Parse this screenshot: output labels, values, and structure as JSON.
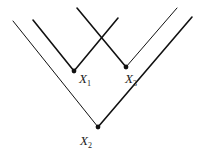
{
  "diagram": {
    "type": "cone-intersection",
    "background": "#ffffff",
    "line_color": "#111111",
    "nodes": [
      {
        "id": "X1",
        "label": "X",
        "subscript": "1",
        "x": 74,
        "y": 71,
        "left_arm": [
          33,
          20
        ],
        "right_arm": [
          118,
          18
        ]
      },
      {
        "id": "X3",
        "label": "X",
        "subscript": "3",
        "x": 126,
        "y": 67,
        "left_arm": [
          77,
          8
        ],
        "right_arm": [
          177,
          8
        ]
      },
      {
        "id": "X2",
        "label": "X",
        "subscript": "2",
        "x": 98,
        "y": 127,
        "left_arm": [
          13,
          21
        ],
        "right_arm": [
          192,
          17
        ]
      }
    ]
  },
  "labels": {
    "x1": {
      "main": "X",
      "sub": "1"
    },
    "x3": {
      "main": "X",
      "sub": "3"
    },
    "x2": {
      "main": "X",
      "sub": "2"
    }
  }
}
